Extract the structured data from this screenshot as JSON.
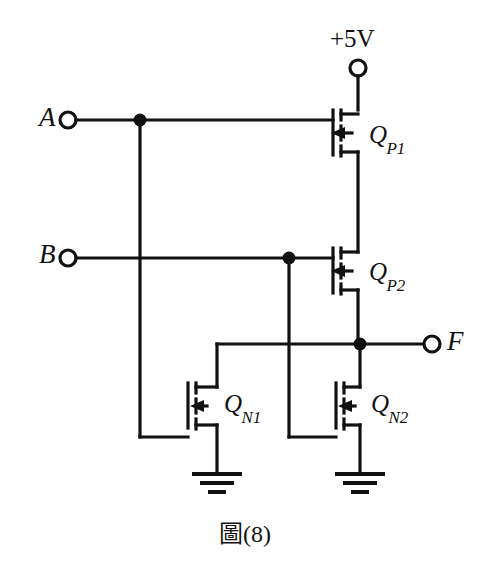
{
  "figure": {
    "caption": "圖(8)",
    "caption_prefix": "圖",
    "caption_number": "(8)"
  },
  "schematic": {
    "type": "CMOS NAND gate",
    "supply_label": "+5V",
    "ground_symbol": "earth-ground",
    "terminals": [
      {
        "id": "supply",
        "label": "+5V",
        "kind": "open-circle",
        "x": 358,
        "y": 68
      },
      {
        "id": "input-a",
        "label": "A",
        "kind": "open-circle",
        "x": 68,
        "y": 120
      },
      {
        "id": "input-b",
        "label": "B",
        "kind": "open-circle",
        "x": 68,
        "y": 258
      },
      {
        "id": "output-f",
        "label": "F",
        "kind": "open-circle",
        "x": 432,
        "y": 344
      }
    ],
    "transistors": [
      {
        "id": "qp1",
        "label": "Q",
        "subscript": "P1",
        "channel": "PMOS",
        "x": 333,
        "y": 132
      },
      {
        "id": "qp2",
        "label": "Q",
        "subscript": "P2",
        "channel": "PMOS",
        "x": 333,
        "y": 270
      },
      {
        "id": "qn1",
        "label": "Q",
        "subscript": "N1",
        "channel": "NMOS",
        "x": 188,
        "y": 405
      },
      {
        "id": "qn2",
        "label": "Q",
        "subscript": "N2",
        "channel": "NMOS",
        "x": 336,
        "y": 405
      }
    ],
    "junction_dots": [
      {
        "id": "dot-a-branch",
        "x": 140,
        "y": 120
      },
      {
        "id": "dot-b-branch",
        "x": 289,
        "y": 258
      },
      {
        "id": "dot-output-f",
        "x": 360,
        "y": 344
      }
    ],
    "crossings_no_connection": [
      {
        "id": "cross-a-over-b",
        "x": 140,
        "y": 258
      },
      {
        "id": "cross-b-over-output",
        "x": 289,
        "y": 344
      }
    ],
    "colors": {
      "wire": "#111111",
      "background": "#ffffff",
      "label": "#111111"
    }
  }
}
